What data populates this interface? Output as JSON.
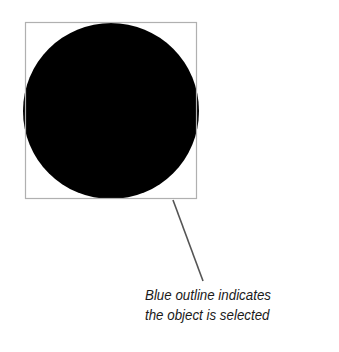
{
  "diagram": {
    "object": {
      "shape": "circle",
      "fill": "#000000",
      "cx": 111,
      "cy": 111,
      "r": 88
    },
    "selection_box": {
      "x": 25,
      "y": 22,
      "width": 172,
      "height": 177,
      "stroke": "#b0b0b0"
    },
    "leader_line": {
      "x1": 173,
      "y1": 200,
      "x2": 203,
      "y2": 281,
      "stroke": "#555555"
    }
  },
  "caption": {
    "line1": "Blue outline indicates",
    "line2": "the object is selected"
  }
}
